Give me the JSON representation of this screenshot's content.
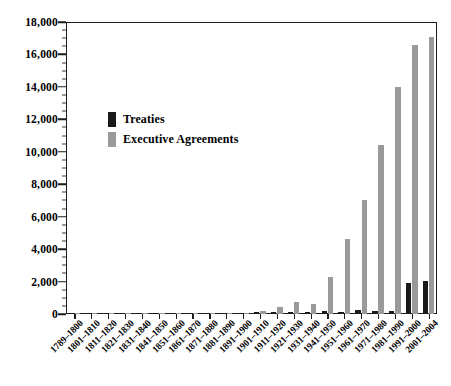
{
  "chart_data": {
    "type": "bar",
    "title": "",
    "xlabel": "",
    "ylabel": "",
    "ylim": [
      0,
      18000
    ],
    "y_major_step": 2000,
    "y_minor_step": 500,
    "grid": false,
    "legend_position": "inside-upper-left",
    "y_tick_labels": [
      "0",
      "2,000",
      "4,000",
      "6,000",
      "8,000",
      "10,000",
      "12,000",
      "14,000",
      "16,000",
      "18,000"
    ],
    "y_tick_values": [
      0,
      2000,
      4000,
      6000,
      8000,
      10000,
      12000,
      14000,
      16000,
      18000
    ],
    "categories": [
      "1789–1800",
      "1801–1810",
      "1811–1820",
      "1821–1830",
      "1831–1840",
      "1841–1850",
      "1851–1860",
      "1861–1870",
      "1871–1880",
      "1881–1890",
      "1891–1900",
      "1901–1910",
      "1911–1920",
      "1921–1930",
      "1931–1940",
      "1941–1950",
      "1951–1960",
      "1961–1970",
      "1971–1980",
      "1981–1990",
      "1991–2000",
      "2001–2004"
    ],
    "series": [
      {
        "name": "Treaties",
        "color": "#1a1a1a",
        "values": [
          60,
          27,
          37,
          34,
          44,
          45,
          60,
          44,
          54,
          50,
          65,
          100,
          115,
          115,
          120,
          160,
          135,
          260,
          180,
          175,
          1925,
          2050
        ]
      },
      {
        "name": "Executive Agreements",
        "color": "#9a9a9a",
        "values": [
          27,
          21,
          20,
          28,
          39,
          57,
          73,
          67,
          75,
          82,
          89,
          204,
          420,
          760,
          640,
          2300,
          4600,
          7000,
          10400,
          14000,
          16600,
          17100
        ]
      }
    ]
  },
  "legend": {
    "items": [
      {
        "label": "Treaties",
        "color": "#1a1a1a"
      },
      {
        "label": "Executive Agreements",
        "color": "#9a9a9a"
      }
    ]
  }
}
